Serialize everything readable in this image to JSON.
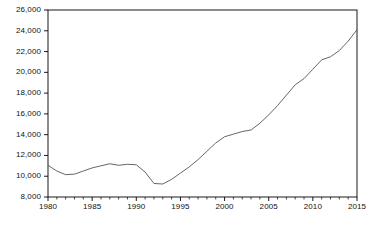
{
  "chart_data": {
    "type": "line",
    "title": "",
    "subtitle": "",
    "xlabel": "",
    "ylabel": "",
    "xlim": [
      1980,
      2015
    ],
    "ylim": [
      8000,
      26000
    ],
    "grid": false,
    "legend": null,
    "line_color": "#555555",
    "frame_color": "#000000",
    "background": "#ffffff",
    "y_ticks": [
      8000,
      10000,
      12000,
      14000,
      16000,
      18000,
      20000,
      22000,
      24000,
      26000
    ],
    "y_tick_labels": [
      "8,000",
      "10,000",
      "12,000",
      "14,000",
      "16,000",
      "18,000",
      "20,000",
      "22,000",
      "24,000",
      "26,000"
    ],
    "x_ticks": [
      1980,
      1985,
      1990,
      1995,
      2000,
      2005,
      2010,
      2015
    ],
    "x_tick_labels": [
      "1980",
      "1985",
      "1990",
      "1995",
      "2000",
      "2005",
      "2010",
      "2015"
    ],
    "x_minor_tick_step": 1,
    "x": [
      1980,
      1981,
      1982,
      1983,
      1984,
      1985,
      1986,
      1987,
      1988,
      1989,
      1990,
      1991,
      1992,
      1993,
      1994,
      1995,
      1996,
      1997,
      1998,
      1999,
      2000,
      2001,
      2002,
      2003,
      2004,
      2005,
      2006,
      2007,
      2008,
      2009,
      2010,
      2011,
      2012,
      2013,
      2014,
      2015
    ],
    "series": [
      {
        "name": "series-1",
        "values": [
          11050,
          10500,
          10150,
          10200,
          10500,
          10800,
          11000,
          11200,
          11050,
          11150,
          11100,
          10400,
          9300,
          9250,
          9700,
          10300,
          10900,
          11600,
          12400,
          13200,
          13800,
          14050,
          14300,
          14450,
          15100,
          15900,
          16800,
          17800,
          18800,
          19400,
          20300,
          21200,
          21500,
          22100,
          23000,
          24100
        ]
      }
    ]
  }
}
